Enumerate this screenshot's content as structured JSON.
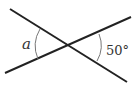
{
  "diagram": {
    "type": "intersecting-lines-angle",
    "angle_left_label": "a",
    "angle_right_label": "50°",
    "line_color": "#222222",
    "arc_color": "#777777",
    "text_color": "#333333"
  }
}
